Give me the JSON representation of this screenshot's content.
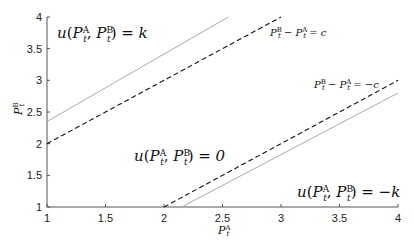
{
  "chart_data": {
    "type": "line",
    "title": "",
    "xlabel": "P_t^A",
    "ylabel": "P_t^B",
    "xlim": [
      1,
      4
    ],
    "ylim": [
      1,
      4
    ],
    "grid": false,
    "xticks": [
      "1",
      "1.5",
      "2",
      "2.5",
      "3",
      "3.5",
      "4"
    ],
    "yticks": [
      "1",
      "1.5",
      "2",
      "2.5",
      "3",
      "3.5",
      "4"
    ],
    "series": [
      {
        "name": "P_t^B - P_t^A = c",
        "style": "dashed",
        "color": "#111111",
        "x": [
          1,
          3
        ],
        "y": [
          2,
          4
        ]
      },
      {
        "name": "P_t^B - P_t^A = -c",
        "style": "dashed",
        "color": "#111111",
        "x": [
          2,
          4
        ],
        "y": [
          1,
          3
        ]
      },
      {
        "name": "upper boundary (solid)",
        "style": "solid",
        "color": "#aaaaaa",
        "x": [
          1,
          2.55
        ],
        "y": [
          2.35,
          4
        ]
      },
      {
        "name": "lower boundary (solid)",
        "style": "solid",
        "color": "#aaaaaa",
        "x": [
          2.15,
          4
        ],
        "y": [
          1,
          2.8
        ]
      }
    ],
    "annotations": [
      {
        "text": "u(P_t^A, P_t^B) = k",
        "x": 1.05,
        "y": 3.75
      },
      {
        "text": "u(P_t^A, P_t^B) = 0",
        "x": 1.95,
        "y": 2.05
      },
      {
        "text": "u(P_t^A, P_t^B) = -k",
        "x": 2.95,
        "y": 1.35
      },
      {
        "text": "P_t^B - P_t^A = c",
        "x": 2.85,
        "y": 3.7
      },
      {
        "text": "P_t^B - P_t^A = -c",
        "x": 3.3,
        "y": 3.1
      }
    ]
  },
  "labels": {
    "xlabel_base": "P",
    "xlabel_sub": "t",
    "xlabel_sup": "A",
    "ylabel_base": "P",
    "ylabel_sub": "t",
    "ylabel_sup": "B",
    "ann_k": "u(P",
    "ann_0": "u(P",
    "ann_mk": "u(P"
  }
}
